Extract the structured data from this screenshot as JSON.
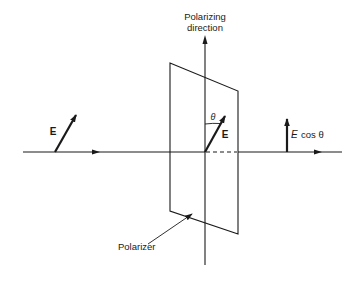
{
  "diagram": {
    "type": "polarizer-physics-diagram",
    "labels": {
      "axis_title_line1": "Polarizing",
      "axis_title_line2": "direction",
      "incident_field": "E",
      "field_at_polarizer": "E",
      "angle": "θ",
      "transmitted_field_E": "E",
      "transmitted_field_cos": "cos θ",
      "polarizer": "Polarizer"
    },
    "colors": {
      "stroke": "#1a1a1a",
      "background": "#ffffff"
    }
  }
}
